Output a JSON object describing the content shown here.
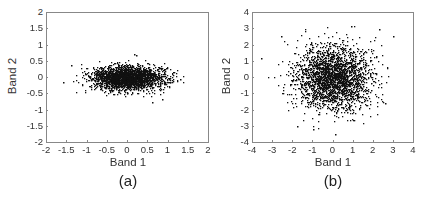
{
  "chart_data": [
    {
      "type": "scatter",
      "caption": "(a)",
      "xlabel": "Band 1",
      "ylabel": "Band 2",
      "xlim": [
        -2,
        2
      ],
      "ylim": [
        -2,
        2
      ],
      "xticks": [
        "-2",
        "-1.5",
        "-1",
        "-0.5",
        "0",
        "0.5",
        "1",
        "1.5",
        "2"
      ],
      "yticks": [
        "2",
        "1.5",
        "1",
        "0.5",
        "0",
        "-0.5",
        "-1",
        "-1.5",
        "-2"
      ],
      "grid": false,
      "point_color": "#111111",
      "distribution": {
        "n_points": 2500,
        "mean": [
          0,
          0
        ],
        "std": [
          0.45,
          0.18
        ],
        "x_range_observed": [
          -1.6,
          1.4
        ],
        "y_range_observed": [
          -0.75,
          0.75
        ],
        "seed": 7
      },
      "notable_points": [
        [
          0.15,
          0.72
        ],
        [
          0.2,
          0.7
        ],
        [
          0.6,
          -0.75
        ],
        [
          0.85,
          -0.68
        ],
        [
          -1.6,
          -0.15
        ],
        [
          -1.4,
          0.4
        ],
        [
          1.3,
          -0.05
        ]
      ]
    },
    {
      "type": "scatter",
      "caption": "(b)",
      "xlabel": "Band 1",
      "ylabel": "Band 2",
      "xlim": [
        -4,
        4
      ],
      "ylim": [
        -4,
        4
      ],
      "xticks": [
        "-4",
        "-3",
        "-2",
        "-1",
        "0",
        "1",
        "2",
        "3",
        "4"
      ],
      "yticks": [
        "4",
        "3",
        "2",
        "1",
        "0",
        "-1",
        "-2",
        "-3",
        "-4"
      ],
      "grid": false,
      "point_color": "#111111",
      "distribution": {
        "n_points": 2500,
        "mean": [
          0,
          0
        ],
        "std": [
          0.95,
          0.95
        ],
        "x_range_observed": [
          -3.6,
          3.1
        ],
        "y_range_observed": [
          -3.5,
          3.2
        ],
        "seed": 13
      },
      "notable_points": [
        [
          -3.6,
          1.2
        ],
        [
          3.0,
          2.6
        ],
        [
          2.3,
          3.0
        ],
        [
          0.9,
          3.2
        ],
        [
          -1.8,
          -3.0
        ],
        [
          0.1,
          -3.5
        ],
        [
          -1.0,
          -3.2
        ],
        [
          2.6,
          -1.6
        ],
        [
          -2.6,
          2.6
        ]
      ]
    }
  ]
}
